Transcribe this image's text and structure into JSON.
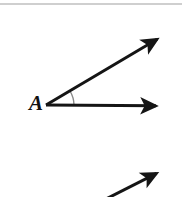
{
  "figure": {
    "kind": "geometry-angle-diagram",
    "background_color": "#ffffff",
    "width": 182,
    "height": 197,
    "top_rule": {
      "name": "page-divider",
      "color": "#cfcfcf",
      "y": 4,
      "x_start": 0,
      "x_end": 182,
      "thickness": 2
    },
    "vertex_label": "A",
    "label_color": "#111111",
    "stroke_color": "#151515",
    "arc_color": "#8a8a8a",
    "angle_degrees": 30,
    "vertex": {
      "x": 46,
      "y": 105
    },
    "rays": [
      {
        "name": "upper-ray",
        "from": {
          "x": 46,
          "y": 105
        },
        "to": {
          "x": 171,
          "y": 31
        },
        "arrowhead": "end",
        "stroke_width": 3
      },
      {
        "name": "horizontal-ray",
        "from": {
          "x": 46,
          "y": 105
        },
        "to": {
          "x": 172,
          "y": 106
        },
        "arrowhead": "end",
        "stroke_width": 3
      }
    ],
    "arc": {
      "name": "angle-arc",
      "radius": 28,
      "start": {
        "x": 70,
        "y": 91
      },
      "end": {
        "x": 74,
        "y": 105
      },
      "stroke_width": 1.4
    },
    "partial_ray": {
      "name": "lower-partial-ray",
      "from": {
        "x": 104,
        "y": 200
      },
      "to": {
        "x": 171,
        "y": 166
      },
      "arrowhead": "end",
      "stroke_width": 3
    }
  }
}
